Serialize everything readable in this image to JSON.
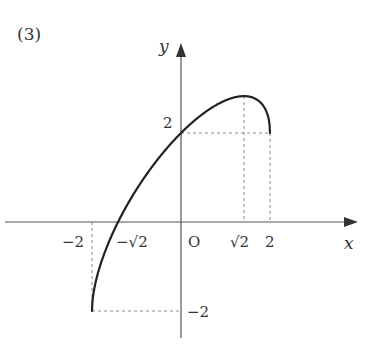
{
  "problem_label": "(3)",
  "axes": {
    "x_label": "x",
    "y_label": "y",
    "origin_label": "O"
  },
  "x_ticks": [
    {
      "label": "−2",
      "value": -2
    },
    {
      "label": "−√2",
      "value": -1.414
    },
    {
      "label": "√2",
      "value": 1.414
    },
    {
      "label": "2",
      "value": 2
    }
  ],
  "y_ticks": [
    {
      "label": "2",
      "value": 2
    },
    {
      "label": "−2",
      "value": -2
    }
  ],
  "chart_data": {
    "type": "line",
    "title": "(3)",
    "xlabel": "x",
    "ylabel": "y",
    "function": "y = x + sqrt(4 - x^2)",
    "domain": [
      -2,
      2
    ],
    "key_points": [
      {
        "x": -2,
        "y": -2,
        "note": "left endpoint"
      },
      {
        "x": -1.414,
        "y": 0,
        "note": "x-intercept (−√2)"
      },
      {
        "x": 0,
        "y": 2,
        "note": "y-intercept"
      },
      {
        "x": 1.414,
        "y": 2.828,
        "note": "maximum (√2, 2√2)"
      },
      {
        "x": 2,
        "y": 2,
        "note": "right endpoint"
      }
    ],
    "x": [
      -2,
      -1.9,
      -1.75,
      -1.5,
      -1.414,
      -1.0,
      -0.5,
      0,
      0.5,
      1.0,
      1.414,
      1.75,
      1.9,
      2
    ],
    "y": [
      -2,
      -1.276,
      -0.782,
      -0.177,
      0,
      0.732,
      1.436,
      2,
      2.436,
      2.732,
      2.828,
      2.718,
      2.524,
      2
    ],
    "guides": [
      "dashed vertical x=-2 from y=0 to y=-2",
      "dashed horizontal y=-2 from x=-2 to x=0",
      "dashed horizontal y=2 from x=0 to x=2",
      "dashed vertical x=√2 from y=0 to y=2√2",
      "dashed vertical x=2 from y=0 to y=2"
    ],
    "grid": false,
    "legend": null
  }
}
